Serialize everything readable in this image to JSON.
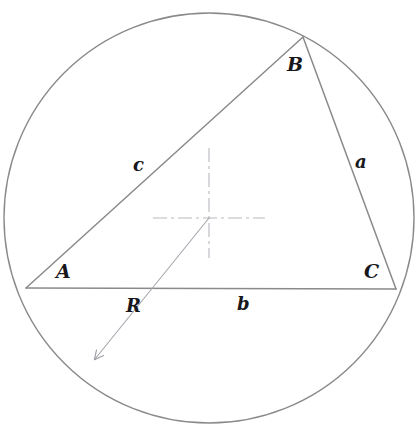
{
  "figure": {
    "type": "geometry-diagram",
    "background_color": "#ffffff",
    "stroke_color": "#8a8a8a",
    "centermark_color": "#b9b9c0",
    "label_color": "#17171c",
    "canvas": {
      "width": 417,
      "height": 435
    }
  },
  "circle": {
    "name": "circumcircle",
    "center_x": 209,
    "center_y": 218,
    "radius": 205,
    "stroke_width": 1.4
  },
  "center_mark": {
    "name": "center-crosshair",
    "x": 209,
    "y": 218,
    "half_length_h": 56,
    "half_length_v": 70,
    "dash_pattern": "14 4 3 4"
  },
  "vertices": [
    {
      "id": "A",
      "label": "A",
      "x": 26,
      "y": 288,
      "label_x": 56,
      "label_y": 262
    },
    {
      "id": "B",
      "label": "B",
      "x": 303,
      "y": 37,
      "label_x": 287,
      "label_y": 55
    },
    {
      "id": "C",
      "label": "C",
      "x": 396,
      "y": 289,
      "label_x": 364,
      "label_y": 262
    }
  ],
  "sides": [
    {
      "id": "a",
      "label": "a",
      "from": "B",
      "to": "C",
      "label_x": 355,
      "label_y": 153
    },
    {
      "id": "b",
      "label": "b",
      "from": "A",
      "to": "C",
      "label_x": 237,
      "label_y": 295
    },
    {
      "id": "c",
      "label": "c",
      "from": "A",
      "to": "B",
      "label_x": 133,
      "label_y": 156
    }
  ],
  "radius_arrow": {
    "id": "R",
    "label": "R",
    "from_x": 209,
    "from_y": 218,
    "to_x": 90,
    "to_y": 364,
    "label_x": 126,
    "label_y": 297,
    "arrowhead": "open-arrow"
  }
}
